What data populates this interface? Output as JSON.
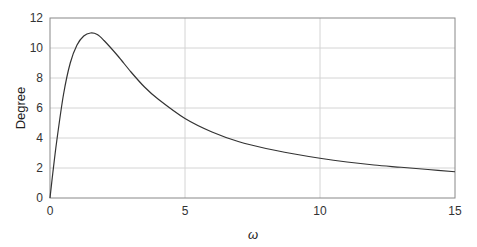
{
  "chart_data": {
    "type": "line",
    "title": "",
    "xlabel": "ω",
    "ylabel": "Degree",
    "xlim": [
      0,
      15
    ],
    "ylim": [
      0,
      12
    ],
    "xticks": [
      0,
      5,
      10,
      15
    ],
    "yticks": [
      0,
      2,
      4,
      6,
      8,
      10,
      12
    ],
    "grid": true,
    "legend": null,
    "series": [
      {
        "name": "phase",
        "color": "#333333",
        "x": [
          0,
          0.1,
          0.25,
          0.5,
          0.75,
          1.0,
          1.25,
          1.5,
          1.75,
          2.0,
          2.5,
          3.0,
          3.5,
          4.0,
          5.0,
          6.0,
          7.0,
          8.0,
          9.0,
          10.0,
          11.0,
          12.0,
          13.0,
          14.0,
          15.0
        ],
        "y": [
          0,
          1.6,
          3.8,
          6.9,
          9.0,
          10.2,
          10.8,
          11.0,
          10.9,
          10.5,
          9.5,
          8.4,
          7.4,
          6.6,
          5.3,
          4.4,
          3.75,
          3.3,
          2.95,
          2.65,
          2.4,
          2.2,
          2.05,
          1.9,
          1.75
        ]
      }
    ]
  }
}
